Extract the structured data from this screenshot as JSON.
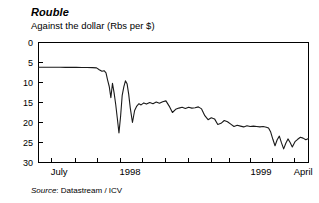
{
  "chart_data": {
    "type": "line",
    "title": "Rouble",
    "subtitle": "Against the dollar (Rbs per $)",
    "source_label": "Source",
    "source_value": "Datastream / ICV",
    "xlabel": "",
    "ylabel": "",
    "y_inverted": true,
    "ylim": [
      0,
      30
    ],
    "yticks": [
      0,
      5,
      10,
      15,
      20,
      25,
      30
    ],
    "ytick_labels": [
      "0",
      "5",
      "10",
      "15",
      "20",
      "25",
      "30"
    ],
    "xlim": [
      0,
      1
    ],
    "xtick_labels": [
      "July",
      "1998",
      "1999",
      "April"
    ],
    "xtick_label_positions": [
      0.045,
      0.3,
      0.785,
      0.945
    ],
    "xtick_positions": [
      0.045,
      0.135,
      0.215,
      0.3,
      0.385,
      0.47,
      0.555,
      0.64,
      0.705,
      0.785,
      0.865,
      0.945
    ],
    "grid": false,
    "legend": null,
    "line_color": "#1a1a1a",
    "frame_color": "#000000",
    "series": [
      {
        "name": "Rouble per US dollar",
        "x": [
          0.0,
          0.02,
          0.04,
          0.06,
          0.08,
          0.1,
          0.12,
          0.14,
          0.16,
          0.18,
          0.2,
          0.215,
          0.225,
          0.235,
          0.243,
          0.25,
          0.256,
          0.262,
          0.268,
          0.274,
          0.28,
          0.286,
          0.292,
          0.298,
          0.304,
          0.31,
          0.316,
          0.322,
          0.328,
          0.334,
          0.34,
          0.348,
          0.356,
          0.364,
          0.372,
          0.38,
          0.39,
          0.4,
          0.412,
          0.424,
          0.436,
          0.448,
          0.46,
          0.472,
          0.484,
          0.496,
          0.508,
          0.52,
          0.532,
          0.544,
          0.556,
          0.568,
          0.58,
          0.592,
          0.604,
          0.616,
          0.628,
          0.64,
          0.652,
          0.664,
          0.676,
          0.688,
          0.7,
          0.712,
          0.724,
          0.736,
          0.748,
          0.76,
          0.772,
          0.784,
          0.796,
          0.808,
          0.82,
          0.832,
          0.844,
          0.852,
          0.86,
          0.868,
          0.876,
          0.884,
          0.892,
          0.9,
          0.908,
          0.916,
          0.924,
          0.932,
          0.94,
          0.95,
          0.96,
          0.97,
          0.98,
          0.99,
          1.0
        ],
        "y": [
          6.2,
          6.2,
          6.2,
          6.2,
          6.2,
          6.21,
          6.22,
          6.23,
          6.24,
          6.25,
          6.27,
          6.35,
          6.8,
          7.2,
          7.05,
          7.6,
          9.4,
          11.0,
          13.8,
          10.2,
          12.6,
          15.5,
          19.0,
          22.6,
          18.5,
          13.2,
          11.1,
          9.6,
          10.3,
          12.9,
          16.4,
          20.0,
          17.0,
          15.9,
          15.3,
          15.6,
          15.1,
          15.4,
          15.0,
          15.3,
          14.9,
          15.2,
          14.8,
          14.6,
          15.9,
          17.5,
          16.7,
          16.4,
          16.2,
          16.5,
          16.2,
          16.4,
          16.3,
          16.1,
          16.6,
          18.3,
          19.3,
          18.8,
          19.1,
          20.5,
          20.2,
          19.5,
          19.8,
          20.4,
          21.0,
          20.7,
          20.9,
          21.1,
          20.8,
          21.0,
          20.9,
          21.0,
          21.1,
          21.0,
          21.2,
          21.4,
          22.4,
          24.2,
          25.8,
          24.3,
          23.4,
          25.1,
          26.6,
          25.2,
          24.1,
          25.0,
          26.1,
          24.8,
          24.2,
          23.7,
          23.9,
          24.3,
          24.0
        ]
      }
    ]
  }
}
